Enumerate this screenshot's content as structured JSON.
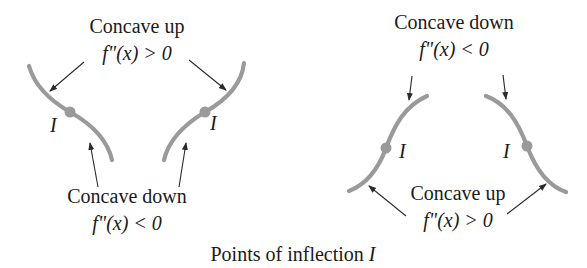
{
  "figure": {
    "caption_text": "Points of inflection ",
    "caption_symbol": "I",
    "left_group": {
      "top_label": {
        "title": "Concave up",
        "condition": "f\"(x) > 0"
      },
      "bottom_label": {
        "title": "Concave down",
        "condition": "f\"(x) < 0"
      },
      "curves": [
        {
          "id": "left-curve-1",
          "inflection_label": "I"
        },
        {
          "id": "left-curve-2",
          "inflection_label": "I"
        }
      ]
    },
    "right_group": {
      "top_label": {
        "title": "Concave down",
        "condition": "f\"(x) < 0"
      },
      "bottom_label": {
        "title": "Concave up",
        "condition": "f\"(x) > 0"
      },
      "curves": [
        {
          "id": "right-curve-1",
          "inflection_label": "I"
        },
        {
          "id": "right-curve-2",
          "inflection_label": "I"
        }
      ]
    },
    "colors": {
      "curve": "#9a9a9a",
      "text": "#1a1a1a",
      "arrow": "#2a2a2a",
      "background": "#ffffff"
    }
  }
}
